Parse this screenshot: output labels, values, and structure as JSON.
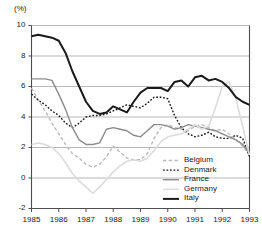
{
  "chart_data": {
    "type": "line",
    "title": "",
    "subtitle": "",
    "xlabel": "",
    "ylabel": "",
    "unit_label": "(%)",
    "xlim": [
      1985,
      1993
    ],
    "ylim": [
      -2,
      10
    ],
    "grid": true,
    "legend_position": "bottom-right",
    "ytick_labels": [
      "10",
      "8",
      "6",
      "4",
      "2",
      "0",
      "-2"
    ],
    "ytick_values": [
      10,
      8,
      6,
      4,
      2,
      0,
      -2
    ],
    "xtick_labels": [
      "1985",
      "1986",
      "1987",
      "1988",
      "1989",
      "1990",
      "1991",
      "1992",
      "1993"
    ],
    "xtick_values": [
      1985,
      1986,
      1987,
      1988,
      1989,
      1990,
      1991,
      1992,
      1993
    ],
    "x": [
      1985.0,
      1985.25,
      1985.5,
      1985.75,
      1986.0,
      1986.25,
      1986.5,
      1986.75,
      1987.0,
      1987.25,
      1987.5,
      1987.75,
      1988.0,
      1988.25,
      1988.5,
      1988.75,
      1989.0,
      1989.25,
      1989.5,
      1989.75,
      1990.0,
      1990.25,
      1990.5,
      1990.75,
      1991.0,
      1991.25,
      1991.5,
      1991.75,
      1992.0,
      1992.25,
      1992.5,
      1992.75,
      1993.0
    ],
    "series": [
      {
        "name": "Belgium",
        "color": "#b9b9b9",
        "style": "dashed",
        "width": 1.4,
        "values": [
          5.9,
          5.1,
          4.4,
          3.6,
          2.9,
          2.2,
          1.6,
          1.3,
          0.9,
          0.7,
          0.9,
          1.4,
          2.1,
          1.7,
          1.3,
          1.2,
          1.2,
          1.6,
          2.6,
          3.3,
          3.5,
          3.3,
          3.2,
          3.1,
          3.4,
          3.5,
          3.3,
          3.1,
          3.2,
          2.9,
          2.5,
          2.1,
          1.5
        ]
      },
      {
        "name": "Denmark",
        "color": "#1a1a1a",
        "style": "dotted",
        "width": 1.4,
        "values": [
          5.5,
          5.1,
          4.8,
          4.4,
          4.1,
          3.6,
          3.3,
          3.6,
          4.0,
          4.1,
          4.1,
          4.2,
          4.4,
          4.6,
          4.8,
          4.7,
          4.6,
          4.9,
          5.3,
          5.3,
          5.2,
          4.1,
          3.3,
          2.9,
          2.7,
          2.8,
          3.0,
          2.7,
          2.6,
          2.6,
          2.8,
          2.6,
          1.4
        ]
      },
      {
        "name": "France",
        "color": "#8c8c8c",
        "style": "solid",
        "width": 1.4,
        "values": [
          6.5,
          6.5,
          6.5,
          6.4,
          5.5,
          4.5,
          3.3,
          2.5,
          2.2,
          2.2,
          2.3,
          3.2,
          3.3,
          3.2,
          3.1,
          2.8,
          2.7,
          3.1,
          3.5,
          3.5,
          3.4,
          3.2,
          3.3,
          3.5,
          3.4,
          3.3,
          3.2,
          3.1,
          2.9,
          2.7,
          2.5,
          2.2,
          1.6
        ]
      },
      {
        "name": "Germany",
        "color": "#dcdcdc",
        "style": "solid",
        "width": 1.6,
        "values": [
          2.2,
          2.3,
          2.2,
          2.0,
          1.6,
          1.0,
          0.3,
          -0.2,
          -0.6,
          -1.0,
          -0.6,
          -0.1,
          0.4,
          0.8,
          1.1,
          1.2,
          1.1,
          1.3,
          1.8,
          2.4,
          2.7,
          2.8,
          2.9,
          3.2,
          3.5,
          3.2,
          3.4,
          4.6,
          6.0,
          6.3,
          5.2,
          3.4,
          1.5
        ]
      },
      {
        "name": "Italy",
        "color": "#1a1a1a",
        "style": "solid",
        "width": 2.0,
        "values": [
          9.3,
          9.4,
          9.3,
          9.2,
          9.0,
          8.2,
          7.0,
          6.0,
          5.0,
          4.4,
          4.2,
          4.3,
          4.7,
          4.5,
          4.3,
          5.0,
          5.6,
          5.9,
          5.9,
          5.9,
          5.7,
          6.3,
          6.4,
          6.0,
          6.6,
          6.7,
          6.4,
          6.5,
          6.3,
          5.9,
          5.3,
          5.0,
          4.8
        ]
      }
    ]
  },
  "legend": {
    "items": [
      {
        "label": "Belgium"
      },
      {
        "label": "Denmark"
      },
      {
        "label": "France"
      },
      {
        "label": "Germany"
      },
      {
        "label": "Italy"
      }
    ]
  }
}
